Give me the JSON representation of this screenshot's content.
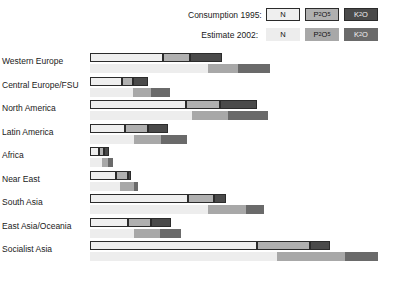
{
  "legend": {
    "rows": [
      {
        "label": "Consumption 1995:",
        "style": "bordered",
        "items": [
          {
            "name": "N",
            "sub": "",
            "tail": "",
            "color": "#efefef"
          },
          {
            "name": "P",
            "sub": "2",
            "tail": "O5",
            "color": "#b0b0b0"
          },
          {
            "name": "K",
            "sub": "2",
            "tail": "O",
            "color": "#4a4a4a"
          }
        ]
      },
      {
        "label": "Estimate 2002:",
        "style": "plain",
        "items": [
          {
            "name": "N",
            "sub": "",
            "tail": "",
            "color": "#ededed"
          },
          {
            "name": "P",
            "sub": "2",
            "tail": "O5",
            "color": "#a8a8a8"
          },
          {
            "name": "K",
            "sub": "2",
            "tail": "O",
            "color": "#6a6a6a"
          }
        ]
      }
    ]
  },
  "chart_data": {
    "type": "bar",
    "orientation": "horizontal",
    "stacked": true,
    "title": "",
    "xlabel": "",
    "ylabel": "",
    "grid": false,
    "legend_position": "top-right",
    "units": "million tonnes nutrients",
    "nutrients": [
      "N",
      "P2O5",
      "K2O"
    ],
    "series_groups": [
      "Consumption 1995",
      "Estimate 2002"
    ],
    "categories": [
      "Western Europe",
      "Central Europe/FSU",
      "North America",
      "Latin America",
      "Africa",
      "Near East",
      "South Asia",
      "East Asia/Oceania",
      "Socialist Asia"
    ],
    "series": [
      {
        "name": "Consumption 1995",
        "stacks": [
          {
            "category": "Western Europe",
            "N": 9.6,
            "P2O5": 3.2,
            "K2O": 3.7
          },
          {
            "category": "Central Europe/FSU",
            "N": 3.3,
            "P2O5": 1.0,
            "K2O": 1.2
          },
          {
            "category": "North America",
            "N": 13.0,
            "P2O5": 4.8,
            "K2O": 5.0
          },
          {
            "category": "Latin America",
            "N": 3.3,
            "P2O5": 1.8,
            "K2O": 2.0
          },
          {
            "category": "Africa",
            "N": 1.1,
            "P2O5": 0.3,
            "K2O": 0.2
          },
          {
            "category": "Near East",
            "N": 3.0,
            "P2O5": 1.0,
            "K2O": 0.2
          },
          {
            "category": "South Asia",
            "N": 13.1,
            "P2O5": 3.6,
            "K2O": 1.4
          },
          {
            "category": "East Asia/Oceania",
            "N": 3.6,
            "P2O5": 2.2,
            "K2O": 1.9
          },
          {
            "category": "Socialist Asia",
            "N": 23.5,
            "P2O5": 7.5,
            "K2O": 2.6
          }
        ]
      },
      {
        "name": "Estimate 2002",
        "stacks": [
          {
            "category": "Western Europe",
            "N": 10.2,
            "P2O5": 3.0,
            "K2O": 3.6
          },
          {
            "category": "Central Europe/FSU",
            "N": 6.0,
            "P2O5": 1.6,
            "K2O": 1.8
          },
          {
            "category": "North America",
            "N": 14.6,
            "P2O5": 5.2,
            "K2O": 5.6
          },
          {
            "category": "Latin America",
            "N": 5.0,
            "P2O5": 2.8,
            "K2O": 2.5
          },
          {
            "category": "Africa",
            "N": 1.4,
            "P2O5": 0.5,
            "K2O": 0.3
          },
          {
            "category": "Near East",
            "N": 3.6,
            "P2O5": 1.2,
            "K2O": 0.3
          },
          {
            "category": "South Asia",
            "N": 17.0,
            "P2O5": 5.0,
            "K2O": 2.0
          },
          {
            "category": "East Asia/Oceania",
            "N": 4.6,
            "P2O5": 2.6,
            "K2O": 2.1
          },
          {
            "category": "Socialist Asia",
            "N": 27.0,
            "P2O5": 9.0,
            "K2O": 3.6
          }
        ]
      }
    ],
    "pixel_layout": {
      "note": "Rendered segment extents in source pixels, x0=90 baseline, right edge 390",
      "rows": [
        {
          "category": "Western Europe",
          "b1995": [
            {
              "nutrient": "N",
              "x0": 0,
              "x1": 73
            },
            {
              "nutrient": "P2O5",
              "x0": 73,
              "x1": 100
            },
            {
              "nutrient": "K2O",
              "x0": 100,
              "x1": 132
            }
          ],
          "b2002": [
            {
              "nutrient": "N",
              "x0": 0,
              "x1": 118
            },
            {
              "nutrient": "P2O5",
              "x0": 118,
              "x1": 148
            },
            {
              "nutrient": "K2O",
              "x0": 148,
              "x1": 180
            }
          ]
        },
        {
          "category": "Central Europe/FSU",
          "b1995": [
            {
              "nutrient": "N",
              "x0": 0,
              "x1": 32
            },
            {
              "nutrient": "P2O5",
              "x0": 32,
              "x1": 43
            },
            {
              "nutrient": "K2O",
              "x0": 43,
              "x1": 58
            }
          ],
          "b2002": [
            {
              "nutrient": "N",
              "x0": 0,
              "x1": 43
            },
            {
              "nutrient": "P2O5",
              "x0": 43,
              "x1": 61
            },
            {
              "nutrient": "K2O",
              "x0": 61,
              "x1": 80
            }
          ]
        },
        {
          "category": "North America",
          "b1995": [
            {
              "nutrient": "N",
              "x0": 0,
              "x1": 96
            },
            {
              "nutrient": "P2O5",
              "x0": 96,
              "x1": 130
            },
            {
              "nutrient": "K2O",
              "x0": 130,
              "x1": 167
            }
          ],
          "b2002": [
            {
              "nutrient": "N",
              "x0": 0,
              "x1": 102
            },
            {
              "nutrient": "P2O5",
              "x0": 102,
              "x1": 138
            },
            {
              "nutrient": "K2O",
              "x0": 138,
              "x1": 178
            }
          ]
        },
        {
          "category": "Latin America",
          "b1995": [
            {
              "nutrient": "N",
              "x0": 0,
              "x1": 35
            },
            {
              "nutrient": "P2O5",
              "x0": 35,
              "x1": 58
            },
            {
              "nutrient": "K2O",
              "x0": 58,
              "x1": 78
            }
          ],
          "b2002": [
            {
              "nutrient": "N",
              "x0": 0,
              "x1": 44
            },
            {
              "nutrient": "P2O5",
              "x0": 44,
              "x1": 71
            },
            {
              "nutrient": "K2O",
              "x0": 71,
              "x1": 97
            }
          ]
        },
        {
          "category": "Africa",
          "b1995": [
            {
              "nutrient": "N",
              "x0": 0,
              "x1": 9
            },
            {
              "nutrient": "P2O5",
              "x0": 9,
              "x1": 14
            },
            {
              "nutrient": "K2O",
              "x0": 14,
              "x1": 19
            }
          ],
          "b2002": [
            {
              "nutrient": "N",
              "x0": 0,
              "x1": 12
            },
            {
              "nutrient": "P2O5",
              "x0": 12,
              "x1": 18
            },
            {
              "nutrient": "K2O",
              "x0": 18,
              "x1": 23
            }
          ]
        },
        {
          "category": "Near East",
          "b1995": [
            {
              "nutrient": "N",
              "x0": 0,
              "x1": 26
            },
            {
              "nutrient": "P2O5",
              "x0": 26,
              "x1": 38
            },
            {
              "nutrient": "K2O",
              "x0": 38,
              "x1": 41
            }
          ],
          "b2002": [
            {
              "nutrient": "N",
              "x0": 0,
              "x1": 30
            },
            {
              "nutrient": "P2O5",
              "x0": 30,
              "x1": 44
            },
            {
              "nutrient": "K2O",
              "x0": 44,
              "x1": 48
            }
          ]
        },
        {
          "category": "South Asia",
          "b1995": [
            {
              "nutrient": "N",
              "x0": 0,
              "x1": 98
            },
            {
              "nutrient": "P2O5",
              "x0": 98,
              "x1": 124
            },
            {
              "nutrient": "K2O",
              "x0": 124,
              "x1": 136
            }
          ],
          "b2002": [
            {
              "nutrient": "N",
              "x0": 0,
              "x1": 118
            },
            {
              "nutrient": "P2O5",
              "x0": 118,
              "x1": 156
            },
            {
              "nutrient": "K2O",
              "x0": 156,
              "x1": 174
            }
          ]
        },
        {
          "category": "East Asia/Oceania",
          "b1995": [
            {
              "nutrient": "N",
              "x0": 0,
              "x1": 38
            },
            {
              "nutrient": "P2O5",
              "x0": 38,
              "x1": 61
            },
            {
              "nutrient": "K2O",
              "x0": 61,
              "x1": 81
            }
          ],
          "b2002": [
            {
              "nutrient": "N",
              "x0": 0,
              "x1": 44
            },
            {
              "nutrient": "P2O5",
              "x0": 44,
              "x1": 70
            },
            {
              "nutrient": "K2O",
              "x0": 70,
              "x1": 91
            }
          ]
        },
        {
          "category": "Socialist Asia",
          "b1995": [
            {
              "nutrient": "N",
              "x0": 0,
              "x1": 167
            },
            {
              "nutrient": "P2O5",
              "x0": 167,
              "x1": 220
            },
            {
              "nutrient": "K2O",
              "x0": 220,
              "x1": 240
            }
          ],
          "b2002": [
            {
              "nutrient": "N",
              "x0": 0,
              "x1": 187
            },
            {
              "nutrient": "P2O5",
              "x0": 187,
              "x1": 255
            },
            {
              "nutrient": "K2O",
              "x0": 255,
              "x1": 288
            }
          ]
        }
      ]
    }
  }
}
